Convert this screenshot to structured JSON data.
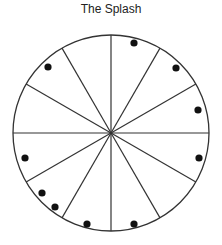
{
  "title": "The Splash",
  "diagram": {
    "center": [
      111,
      133
    ],
    "radius": 98,
    "sectors": 12,
    "line_color": "#333333",
    "dot_color": "#111111",
    "dots": [
      {
        "x": 48,
        "y": 67
      },
      {
        "x": 134,
        "y": 43
      },
      {
        "x": 176,
        "y": 68
      },
      {
        "x": 198,
        "y": 110
      },
      {
        "x": 25,
        "y": 158
      },
      {
        "x": 42,
        "y": 193
      },
      {
        "x": 55,
        "y": 207
      },
      {
        "x": 87,
        "y": 224
      },
      {
        "x": 199,
        "y": 158
      },
      {
        "x": 134,
        "y": 224
      }
    ]
  }
}
